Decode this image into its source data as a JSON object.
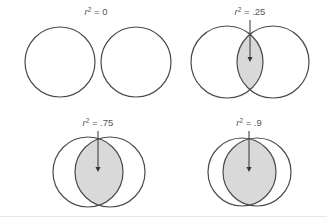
{
  "diagram": {
    "colors": {
      "stroke": "#4a4a4a",
      "overlap_fill": "#d9d9d9",
      "label_text": "#555555",
      "background": "#ffffff"
    },
    "panels": [
      {
        "id": "r2-0",
        "label_base": "r",
        "label_exp": "2",
        "label_rest": " = 0",
        "value": 0,
        "label_x": 96,
        "label_y": 15,
        "circle_a": {
          "cx": 60,
          "cy": 62,
          "r": 35
        },
        "circle_b": {
          "cx": 136,
          "cy": 62,
          "r": 35
        },
        "arrow": null
      },
      {
        "id": "r2-25",
        "label_base": "r",
        "label_exp": "2",
        "label_rest": " = .25",
        "value": 0.25,
        "label_x": 250,
        "label_y": 15,
        "circle_a": {
          "cx": 227,
          "cy": 62,
          "r": 36
        },
        "circle_b": {
          "cx": 273,
          "cy": 62,
          "r": 36
        },
        "arrow": {
          "x": 250,
          "y1": 20,
          "y2": 62
        }
      },
      {
        "id": "r2-75",
        "label_base": "r",
        "label_exp": "2",
        "label_rest": " = .75",
        "value": 0.75,
        "label_x": 98,
        "label_y": 126,
        "circle_a": {
          "cx": 88,
          "cy": 172,
          "r": 35
        },
        "circle_b": {
          "cx": 110,
          "cy": 172,
          "r": 35
        },
        "arrow": {
          "x": 98,
          "y1": 131,
          "y2": 172
        }
      },
      {
        "id": "r2-9",
        "label_base": "r",
        "label_exp": "2",
        "label_rest": " = .9",
        "value": 0.9,
        "label_x": 249,
        "label_y": 126,
        "circle_a": {
          "cx": 242,
          "cy": 172,
          "r": 34
        },
        "circle_b": {
          "cx": 257,
          "cy": 172,
          "r": 34
        },
        "arrow": {
          "x": 249,
          "y1": 131,
          "y2": 172
        }
      }
    ]
  }
}
